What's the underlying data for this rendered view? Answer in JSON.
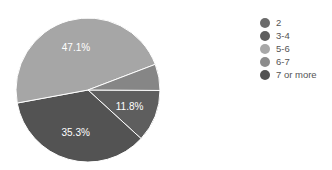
{
  "chart_data": {
    "type": "pie",
    "title": "",
    "categories": [
      "2",
      "3-4",
      "5-6",
      "6-7",
      "7 or more"
    ],
    "values": [
      0,
      11.8,
      47.1,
      5.9,
      35.3
    ],
    "slice_labels": {
      "3-4": "11.8%",
      "7 or more": "35.3%",
      "5-6": "47.1%"
    },
    "colors": {
      "2": "#6b6b6b",
      "3-4": "#5e5e5e",
      "5-6": "#a6a6a6",
      "6-7": "#868686",
      "7 or more": "#535353"
    },
    "start_angle_deg": 0,
    "direction": "clockwise",
    "legend_position": "right"
  },
  "legend": {
    "items": [
      {
        "label": "2",
        "color": "#6b6b6b"
      },
      {
        "label": "3-4",
        "color": "#5e5e5e"
      },
      {
        "label": "5-6",
        "color": "#a8a8a8"
      },
      {
        "label": "6-7",
        "color": "#8c8c8c"
      },
      {
        "label": "7 or more",
        "color": "#535353"
      }
    ]
  }
}
